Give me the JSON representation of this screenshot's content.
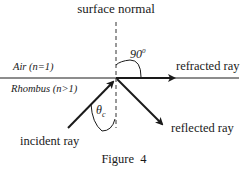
{
  "figure": {
    "caption": "Figure  4",
    "labels": {
      "surface_normal": "surface normal",
      "upper_medium": "Air (n=1)",
      "lower_medium": "Rhombus (n>1)",
      "refracted_ray": "refracted ray",
      "reflected_ray": "reflected ray",
      "incident_ray": "incident ray",
      "angle_refracted": "90",
      "angle_refracted_sup": "0",
      "angle_critical": "θ",
      "angle_critical_sub": "c"
    },
    "colors": {
      "line": "#1a1a1a",
      "background": "#ffffff"
    }
  }
}
